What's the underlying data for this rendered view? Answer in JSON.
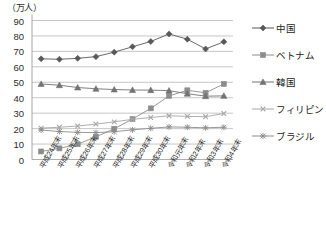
{
  "chart_data": {
    "type": "line",
    "title": "",
    "ylabel": "（万人）",
    "xlabel": "",
    "ylim": [
      0,
      90
    ],
    "yticks": [
      0,
      10,
      20,
      30,
      40,
      50,
      60,
      70,
      80,
      90
    ],
    "grid": true,
    "legend_position": "right",
    "categories": [
      "平成24年末",
      "平成25年末",
      "平成26年末",
      "平成27年末",
      "平成28年末",
      "平成29年末",
      "平成30年末",
      "令和元年末",
      "令和2年末",
      "令和3年末",
      "令和4年末"
    ],
    "series": [
      {
        "name": "中国",
        "marker": "diamond",
        "color": "#595959",
        "values": [
          65.2,
          64.9,
          65.5,
          66.6,
          69.5,
          73.0,
          76.4,
          81.3,
          77.9,
          71.6,
          76.2
        ]
      },
      {
        "name": "ベトナム",
        "marker": "square",
        "color": "#8c8c8c",
        "values": [
          5.2,
          7.2,
          9.9,
          14.7,
          19.9,
          26.2,
          33.1,
          41.2,
          44.8,
          43.2,
          48.9
        ]
      },
      {
        "name": "韓国",
        "marker": "triangle",
        "color": "#737373",
        "values": [
          48.9,
          48.1,
          46.6,
          45.8,
          45.3,
          45.0,
          44.9,
          44.6,
          42.6,
          41.0,
          41.2
        ]
      },
      {
        "name": "フィリピン",
        "marker": "x-cross",
        "color": "#a6a6a6",
        "values": [
          20.3,
          20.9,
          21.7,
          22.9,
          24.4,
          26.0,
          27.2,
          28.3,
          27.9,
          27.7,
          29.8
        ]
      },
      {
        "name": "ブラジル",
        "marker": "star",
        "color": "#8c8c8c",
        "values": [
          19.1,
          18.1,
          17.6,
          17.4,
          18.0,
          19.2,
          20.2,
          21.1,
          20.9,
          20.5,
          20.9
        ]
      }
    ]
  },
  "legend": {
    "items": [
      {
        "label": "中国"
      },
      {
        "label": "ベトナム"
      },
      {
        "label": "韓国"
      },
      {
        "label": "フィリピン"
      },
      {
        "label": "ブラジル"
      }
    ]
  },
  "axis": {
    "unit": "（万人）"
  }
}
